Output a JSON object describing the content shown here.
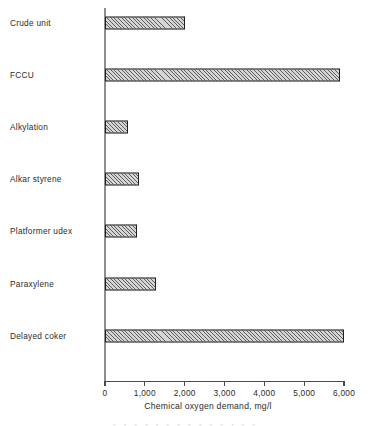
{
  "chart_data": {
    "type": "bar",
    "orientation": "horizontal",
    "title": "",
    "subtitle": "",
    "xlabel": "Chemical oxygen demand, mg/l",
    "ylabel": "",
    "xlim": [
      0,
      6000
    ],
    "xticks": [
      0,
      1000,
      2000,
      3000,
      4000,
      5000,
      6000
    ],
    "xtick_labels": [
      "0",
      "1,000",
      "2,000",
      "3,000",
      "4,000",
      "5,000",
      "6,000"
    ],
    "grid": false,
    "legend": null,
    "legend_position": "none",
    "units": "mg/l",
    "categories": [
      "Crude unit",
      "FCCU",
      "Alkylation",
      "Alkar styrene",
      "Platformer udex",
      "Paraxylene",
      "Delayed coker"
    ],
    "values": [
      2000,
      5900,
      580,
      850,
      800,
      1280,
      6000
    ],
    "series": [
      {
        "name": "Chemical oxygen demand",
        "values": [
          2000,
          5900,
          580,
          850,
          800,
          1280,
          6000
        ]
      }
    ],
    "bars": [
      {
        "label": "Crude unit",
        "value": 2000
      },
      {
        "label": "FCCU",
        "value": 5900
      },
      {
        "label": "Alkylation",
        "value": 580
      },
      {
        "label": "Alkar styrene",
        "value": 850
      },
      {
        "label": "Platformer udex",
        "value": 800
      },
      {
        "label": "Paraxylene",
        "value": 1280
      },
      {
        "label": "Delayed coker",
        "value": 6000
      }
    ],
    "style": {
      "bar_fill": "#d6d6d6",
      "bar_hatch": "diagonal",
      "bar_edge": "#1f1f1f",
      "axis_color": "#4a4a4a",
      "background": "#ffffff",
      "text_color": "#2b2b2b"
    }
  },
  "clipped_text": "·  ·  ·    · ·  · ·   ·   · ·   ·  ·   · ·"
}
